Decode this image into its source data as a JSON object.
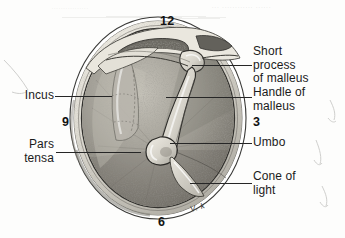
{
  "figure": {
    "background_color": "#fdfdfc",
    "ink_color": "#262626"
  },
  "ghost_text": {
    "top_faint_1": "................",
    "top_faint_2": "...  ............  ......"
  },
  "labels": {
    "left": [
      {
        "id": "incus",
        "text": "Incus",
        "x": 22,
        "y": 89,
        "leader": {
          "x": 55,
          "y": 96,
          "width": 57
        }
      },
      {
        "id": "pars-tensa",
        "text": "Pars\ntensa",
        "x": 22,
        "y": 138,
        "leader": {
          "x": 56,
          "y": 152,
          "width": 85
        }
      }
    ],
    "right": [
      {
        "id": "short-process-of-malleus",
        "text": "Short\nprocess\nof malleus",
        "x": 253,
        "y": 45,
        "leader": {
          "x": 192,
          "y": 65,
          "width": 60
        }
      },
      {
        "id": "handle-of-malleus",
        "text": "Handle of\nmalleus",
        "x": 253,
        "y": 86,
        "leader": {
          "x": 166,
          "y": 97,
          "width": 86
        }
      },
      {
        "id": "umbo",
        "text": "Umbo",
        "x": 253,
        "y": 136,
        "leader": {
          "x": 170,
          "y": 143,
          "width": 82
        }
      },
      {
        "id": "cone-of-light",
        "text": "Cone of\nlight",
        "x": 253,
        "y": 170,
        "leader": {
          "x": 190,
          "y": 183,
          "width": 62
        }
      }
    ]
  },
  "clock_positions": [
    {
      "id": "twelve",
      "value": "12",
      "x": 160,
      "y": 14
    },
    {
      "id": "three",
      "value": "3",
      "x": 253,
      "y": 115
    },
    {
      "id": "nine",
      "value": "9",
      "x": 62,
      "y": 115
    },
    {
      "id": "six",
      "value": "6",
      "x": 158,
      "y": 215
    }
  ],
  "artist_signature": {
    "text": "V. k",
    "x": 190,
    "y": 206
  },
  "anatomy": {
    "structures": [
      "annulus / canal wall ring",
      "pars flaccida",
      "incus long process",
      "malleus short process (lateral process)",
      "handle of malleus (manubrium)",
      "umbo",
      "pars tensa",
      "cone of light (light reflex)"
    ],
    "palette": {
      "drum_mid": "#9a978f",
      "drum_dark": "#6d6a63",
      "drum_light": "#c9c6bd",
      "ring_light": "#e6e3da",
      "ring_shadow": "#8e8b83",
      "outline": "#2a2a28"
    }
  }
}
